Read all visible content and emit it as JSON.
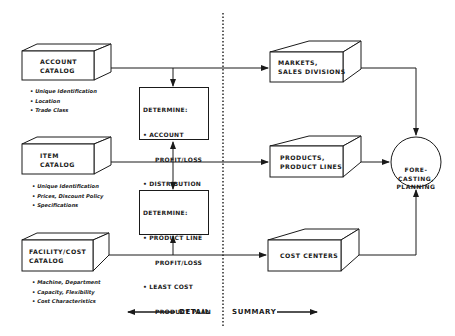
{
  "left_boxes": [
    {
      "title_line1": "ACCOUNT",
      "title_line2": "CATALOG",
      "bullets": [
        "Unique Identification",
        "Location",
        "Trade Class"
      ]
    },
    {
      "title_line1": "ITEM",
      "title_line2": "CATALOG",
      "bullets": [
        "Unique Identification",
        "Prices, Discount Policy",
        "Specifications"
      ]
    },
    {
      "title_line1": "FACILITY/COST",
      "title_line2": "CATALOG",
      "bullets": [
        "Machine, Department",
        "Capacity, Flexibility",
        "Cost Characteristics"
      ]
    }
  ],
  "determine_boxes": [
    {
      "heading": "DETERMINE:",
      "items": [
        {
          "line1": "ACCOUNT",
          "line2": "PROFIT/LOSS"
        },
        {
          "line1": "DISTRIBUTION",
          "line2": ""
        },
        {
          "line1": "PRICE POLICY",
          "line2": "STATUS"
        }
      ]
    },
    {
      "heading": "DETERMINE:",
      "items": [
        {
          "line1": "PRODUCT LINE",
          "line2": "PROFIT/LOSS"
        },
        {
          "line1": "LEAST COST",
          "line2": "PRODUCT PLAN"
        }
      ]
    }
  ],
  "right_boxes": [
    {
      "line1": "MARKETS,",
      "line2": "SALES DIVISIONS"
    },
    {
      "line1": "PRODUCTS,",
      "line2": "PRODUCT LINES"
    },
    {
      "line1": "COST CENTERS",
      "line2": ""
    }
  ],
  "circle": {
    "line1": "FORE-",
    "line2": "CASTING,",
    "line3": "PLANNING"
  },
  "legend": {
    "left": "DETAIL",
    "right": "SUMMARY"
  }
}
